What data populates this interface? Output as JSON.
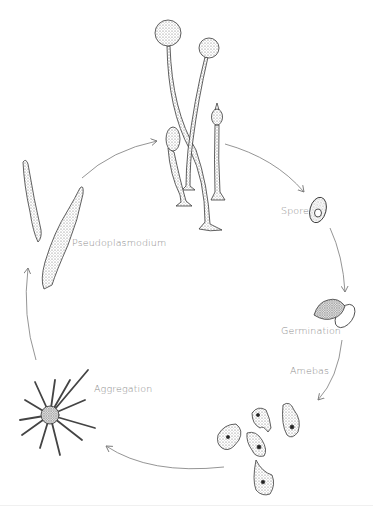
{
  "diagram": {
    "title": "",
    "type": "life-cycle",
    "stages": [
      {
        "id": "fruiting-bodies",
        "label": ""
      },
      {
        "id": "spore",
        "label": "Spore"
      },
      {
        "id": "germination",
        "label": "Germination"
      },
      {
        "id": "amebas",
        "label": "Amebas"
      },
      {
        "id": "aggregation",
        "label": "Aggregation"
      },
      {
        "id": "pseudoplasmodium",
        "label": "Pseudoplasmodium"
      }
    ],
    "labels": {
      "spore": "Spore",
      "germination": "Germination",
      "amebas": "Amebas",
      "aggregation": "Aggregation",
      "pseudoplasmodium": "Pseudoplasmodium"
    },
    "arrows": [
      {
        "from": "pseudoplasmodium",
        "to": "fruiting-bodies"
      },
      {
        "from": "fruiting-bodies",
        "to": "spore"
      },
      {
        "from": "spore",
        "to": "germination"
      },
      {
        "from": "germination",
        "to": "amebas"
      },
      {
        "from": "amebas",
        "to": "aggregation"
      },
      {
        "from": "aggregation",
        "to": "pseudoplasmodium"
      }
    ],
    "colors": {
      "background": "#ffffff",
      "ink": "#3a3a3a",
      "arrow": "#7a7a7a",
      "label": "#8c8c8c"
    }
  }
}
